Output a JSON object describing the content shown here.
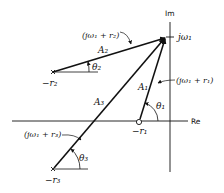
{
  "axes": {
    "imaginary_label": "Im",
    "real_label": "Re"
  },
  "points": {
    "jw1": "jω₁",
    "neg_r1": "−r₁",
    "neg_r2": "−r₂",
    "neg_r3": "−r₃"
  },
  "vectors": {
    "A1": {
      "label": "A₁",
      "expr": "(jω₁ + r₁)",
      "angle": "θ₁"
    },
    "A2": {
      "label": "A₂",
      "expr": "(jω₁ + r₂)",
      "angle": "θ₂"
    },
    "A3": {
      "label": "A₃",
      "expr": "(jω₁ + r₃)",
      "angle": "θ₃"
    }
  },
  "colors": {
    "line": "#111111",
    "background": "#ffffff"
  }
}
